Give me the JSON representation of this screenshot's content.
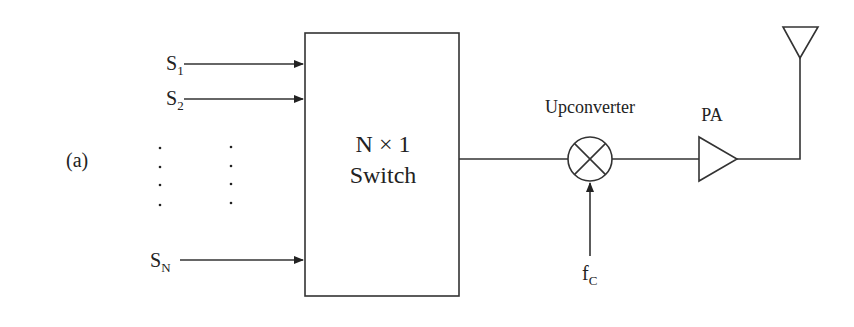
{
  "figure": {
    "panel_label": "(a)",
    "colors": {
      "stroke": "#333333",
      "text": "#222222",
      "background": "#ffffff"
    }
  },
  "inputs": [
    {
      "main": "S",
      "sub": "1"
    },
    {
      "main": "S",
      "sub": "2"
    },
    {
      "main": "S",
      "sub": "N"
    }
  ],
  "switch_block": {
    "line1": "N ×  1",
    "line2": "Switch"
  },
  "upconverter": {
    "label": "Upconverter",
    "symbol": "mixer-x-circle"
  },
  "carrier": {
    "main": "f",
    "sub": "C"
  },
  "amplifier": {
    "label": "PA",
    "symbol": "triangle-amplifier"
  },
  "antenna": {
    "symbol": "inverted-triangle-antenna"
  },
  "ellipsis": {
    "rows": 4,
    "columns": 2
  }
}
